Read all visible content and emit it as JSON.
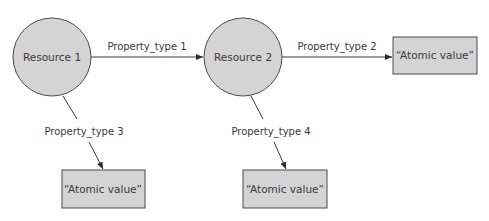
{
  "diagram": {
    "colors": {
      "node_fill": "#d4d4d4",
      "node_stroke": "#4a4a4a",
      "edge": "#3a3a3a",
      "text": "#3a3a3a"
    },
    "nodes": [
      {
        "id": "resource1",
        "shape": "circle",
        "label": "Resource 1"
      },
      {
        "id": "resource2",
        "shape": "circle",
        "label": "Resource 2"
      },
      {
        "id": "atomic_right",
        "shape": "rect",
        "label": "“Atomic value”"
      },
      {
        "id": "atomic_bottom_left",
        "shape": "rect",
        "label": "“Atomic value”"
      },
      {
        "id": "atomic_bottom_mid",
        "shape": "rect",
        "label": "“Atomic value”"
      }
    ],
    "edges": [
      {
        "from": "resource1",
        "to": "resource2",
        "label": "Property_type 1"
      },
      {
        "from": "resource2",
        "to": "atomic_right",
        "label": "Property_type 2"
      },
      {
        "from": "resource1",
        "to": "atomic_bottom_left",
        "label": "Property_type 3"
      },
      {
        "from": "resource2",
        "to": "atomic_bottom_mid",
        "label": "Property_type 4"
      }
    ]
  }
}
